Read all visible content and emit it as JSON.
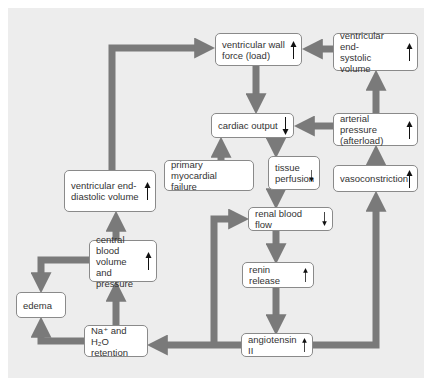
{
  "diagram": {
    "colors": {
      "background": "#ededed",
      "connector": "#7a7a7a",
      "box_fill": "#ffffff",
      "box_border": "#8a8a8a",
      "text": "#333333"
    },
    "nodes": {
      "ventricular_wall_force": {
        "label": "ventricular wall\nforce (load)",
        "indicator": "up"
      },
      "ventricular_end_systolic_volume": {
        "label": "ventricular end-\nsystolic volume",
        "indicator": "up"
      },
      "cardiac_output": {
        "label": "cardiac output",
        "indicator": "down"
      },
      "arterial_pressure": {
        "label": "arterial pressure\n(afterload)",
        "indicator": "up"
      },
      "primary_myocardial_failure": {
        "label": "primary myocardial\nfailure",
        "indicator": "none"
      },
      "tissue_perfusion": {
        "label": "tissue\nperfusion",
        "indicator": "down"
      },
      "vasoconstriction": {
        "label": "vasoconstriction",
        "indicator": "up"
      },
      "ventricular_end_diastolic_volume": {
        "label": "ventricular end-\ndiastolic volume",
        "indicator": "up"
      },
      "renal_blood_flow": {
        "label": "renal blood flow",
        "indicator": "down"
      },
      "central_blood_volume": {
        "label": "central blood\nvolume and\npressure",
        "indicator": "up"
      },
      "renin_release": {
        "label": "renin release",
        "indicator": "up"
      },
      "edema": {
        "label": "edema",
        "indicator": "none"
      },
      "na_h2o_retention": {
        "label": "Na⁺ and H₂O\nretention",
        "indicator": "none"
      },
      "angiotensin_ii": {
        "label": "angiotensin II",
        "indicator": "up"
      }
    },
    "edges": [
      [
        "ventricular_end_diastolic_volume",
        "ventricular_wall_force"
      ],
      [
        "ventricular_end_systolic_volume",
        "ventricular_wall_force"
      ],
      [
        "ventricular_wall_force",
        "cardiac_output"
      ],
      [
        "arterial_pressure",
        "cardiac_output"
      ],
      [
        "arterial_pressure",
        "ventricular_end_systolic_volume"
      ],
      [
        "primary_myocardial_failure",
        "cardiac_output"
      ],
      [
        "cardiac_output",
        "tissue_perfusion"
      ],
      [
        "tissue_perfusion",
        "renal_blood_flow"
      ],
      [
        "vasoconstriction",
        "arterial_pressure"
      ],
      [
        "renal_blood_flow",
        "renin_release"
      ],
      [
        "renin_release",
        "angiotensin_ii"
      ],
      [
        "angiotensin_ii",
        "vasoconstriction"
      ],
      [
        "angiotensin_ii",
        "na_h2o_retention"
      ],
      [
        "angiotensin_ii",
        "renal_blood_flow"
      ],
      [
        "na_h2o_retention",
        "central_blood_volume"
      ],
      [
        "na_h2o_retention",
        "edema"
      ],
      [
        "central_blood_volume",
        "edema"
      ],
      [
        "central_blood_volume",
        "ventricular_end_diastolic_volume"
      ]
    ]
  }
}
